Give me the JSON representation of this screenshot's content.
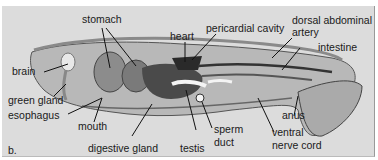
{
  "figure": {
    "panel_label": "b.",
    "colors": {
      "background": "#dcdcdc",
      "body": "#b8b8b8",
      "organ_dark": "#555555",
      "line": "#111111"
    },
    "labels": {
      "stomach": "stomach",
      "heart": "heart",
      "pericardial_cavity": "pericardial cavity",
      "dorsal_abdominal_artery_1": "dorsal abdominal",
      "dorsal_abdominal_artery_2": "artery",
      "intestine": "intestine",
      "brain": "brain",
      "green_gland": "green gland",
      "esophagus": "esophagus",
      "mouth": "mouth",
      "digestive_gland": "digestive gland",
      "testis": "testis",
      "sperm_duct_1": "sperm",
      "sperm_duct_2": "duct",
      "anus": "anus",
      "ventral_nerve_cord_1": "ventral",
      "ventral_nerve_cord_2": "nerve cord"
    }
  }
}
